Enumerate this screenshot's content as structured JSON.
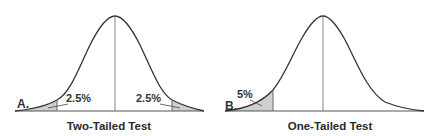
{
  "colors": {
    "curve": "#333333",
    "axis": "#555555",
    "centerline": "#888888",
    "shade": "#cfcfcf",
    "text": "#333333"
  },
  "panels": [
    {
      "id": "A",
      "letter": "A.",
      "title": "Two-Tailed Test",
      "tails": [
        {
          "side": "left",
          "label": "2.5%"
        },
        {
          "side": "right",
          "label": "2.5%"
        }
      ]
    },
    {
      "id": "B",
      "letter": "B.",
      "title": "One-Tailed Test",
      "tails": [
        {
          "side": "left",
          "label": "5%"
        }
      ]
    }
  ]
}
